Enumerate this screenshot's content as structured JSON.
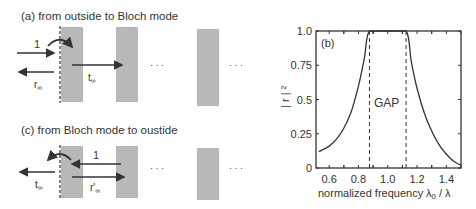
{
  "panel_a": {
    "title": "(a) from outside to Bloch mode",
    "incident_label": "1",
    "reflection_label": "r",
    "reflection_sub": "∞",
    "transmission_label": "t",
    "transmission_sub": "∞",
    "ellipsis": "· · ·"
  },
  "panel_c": {
    "title": "(c) from Bloch mode to oustide",
    "incident_label": "1",
    "transmission_label": "t",
    "transmission_sub": "∞",
    "reflection_label": "r'",
    "reflection_sub": "∞",
    "ellipsis": "· · ·"
  },
  "colors": {
    "slab": "#b8b8b8",
    "line": "#333333"
  },
  "chart_data": {
    "type": "line",
    "panel_label": "(b)",
    "title": "",
    "xlabel": "normalized frequency",
    "xlabel_symbol": "λ0 / λ",
    "ylabel": "| r | ²",
    "annotation": "GAP",
    "xlim": [
      0.51,
      1.5
    ],
    "ylim": [
      0,
      1.0
    ],
    "xticks": [
      "0.6",
      "0.8",
      "1.0",
      "1.2",
      "1.4"
    ],
    "yticks": [
      "0",
      "0.25",
      "0.5",
      "0.75",
      "1.0"
    ],
    "gap_edges": [
      0.875,
      1.125
    ],
    "grid": false,
    "series": [
      {
        "name": "|r|^2",
        "x": [
          0.53,
          0.6,
          0.65,
          0.7,
          0.75,
          0.8,
          0.84,
          0.875,
          1.0,
          1.125,
          1.16,
          1.2,
          1.25,
          1.3,
          1.35,
          1.4,
          1.45,
          1.5
        ],
        "values": [
          0.12,
          0.16,
          0.21,
          0.29,
          0.41,
          0.6,
          0.8,
          1.0,
          1.0,
          1.0,
          0.78,
          0.58,
          0.4,
          0.27,
          0.17,
          0.1,
          0.05,
          0.02
        ]
      }
    ]
  }
}
